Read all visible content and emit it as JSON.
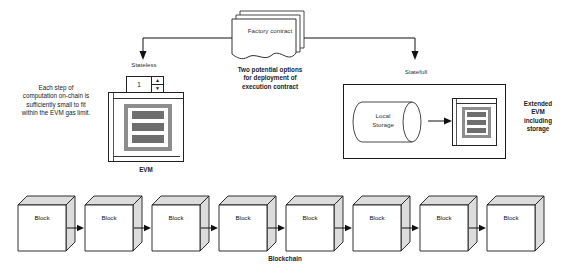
{
  "diagram": {
    "title_caption": {
      "line1": "Two potential options",
      "line2": "for deployment of",
      "line3": "execution contract"
    },
    "factory_contract": {
      "label": "Factory contract",
      "icon": "document-stack-icon"
    },
    "left_note": {
      "line1": "Each step of",
      "line2": "computation on-chain is",
      "line3": "sufficiently small to fit",
      "line4": "within the EVM gas limit."
    },
    "stateless": {
      "header": "Stateless",
      "caption": "EVM",
      "spinner_value": "1",
      "spinner_up_icon": "triangle-up-icon",
      "spinner_down_icon": "triangle-down-icon"
    },
    "statefull": {
      "header": "Statefull",
      "storage_label_line1": "Local",
      "storage_label_line2": "Storage",
      "storage_icon": "cylinder-database-icon",
      "side_caption": {
        "line1": "Extended",
        "line2": "EVM",
        "line3": "including",
        "line4": "storage"
      }
    },
    "blockchain": {
      "caption": "Blockchain",
      "blocks": [
        {
          "label": "Block"
        },
        {
          "label": "Block"
        },
        {
          "label": "Block"
        },
        {
          "label": "Block"
        },
        {
          "label": "Block"
        },
        {
          "label": "Block"
        },
        {
          "label": "Block"
        },
        {
          "label": "Block"
        }
      ]
    },
    "colors": {
      "stroke": "#1a1a1a",
      "screen_frame": "#8d8d8d",
      "screen_bar": "#6e6e6e",
      "background": "#ffffff"
    }
  }
}
